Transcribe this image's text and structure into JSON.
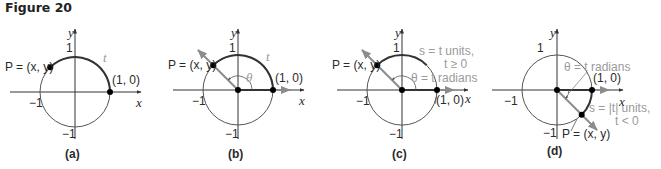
{
  "figure": {
    "title": "Figure 20"
  },
  "panels": [
    {
      "caption": "(a)",
      "point_label": "P = (x, y)",
      "start_label": "(1, 0)",
      "arc_label": "t",
      "axis_x": "x",
      "axis_y": "y",
      "tick_pos_y": "1",
      "tick_neg_x": "−1",
      "tick_neg_y": "−1"
    },
    {
      "caption": "(b)",
      "point_label": "P = (x, y)",
      "start_label": "(1, 0)",
      "arc_label": "t",
      "angle_label": "θ",
      "axis_x": "x",
      "axis_y": "y",
      "tick_pos_y": "1",
      "tick_neg_x": "−1",
      "tick_neg_y": "−1"
    },
    {
      "caption": "(c)",
      "point_label": "P = (x, y)",
      "start_label": "(1, 0)",
      "arc_label_line1": "s = t units,",
      "arc_label_line2": "t ≥ 0",
      "angle_label": "θ = t radians",
      "axis_x": "x",
      "axis_y": "y",
      "tick_pos_y": "1",
      "tick_neg_x": "−1",
      "tick_neg_y": "−1"
    },
    {
      "caption": "(d)",
      "point_label": "P = (x, y)",
      "start_label": "(1, 0)",
      "arc_label_line1": "s = |t| units,",
      "arc_label_line2": "t < 0",
      "angle_label": "θ = t radians",
      "axis_x": "x",
      "axis_y": "y",
      "tick_pos_y": "1",
      "tick_neg_x": "−1",
      "tick_neg_y": "−1"
    }
  ],
  "colors": {
    "circle": "#555555",
    "arc": "#333333",
    "ray": "#8c8c8c",
    "label_gray": "#9a9a9a",
    "point": "#000000"
  }
}
